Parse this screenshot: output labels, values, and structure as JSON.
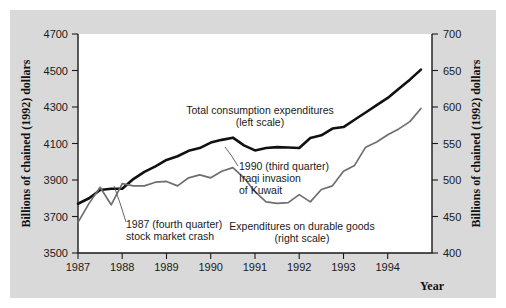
{
  "figure": {
    "background_color": "#d9d9d9",
    "plot_background_color": "#ffffff"
  },
  "chart_data": {
    "type": "line",
    "title": "",
    "xlabel": "Year",
    "ylabel": "Billions of chained (1992) dollars",
    "ylabel_right": "Billions of chained (1992) dollars",
    "xlim": [
      1987.0,
      1995.0
    ],
    "ylim": [
      3500,
      4700
    ],
    "ylim_right": [
      400,
      700
    ],
    "grid": false,
    "legend_position": "inline-annotations",
    "xticks": [
      1987,
      1988,
      1989,
      1990,
      1991,
      1992,
      1993,
      1994
    ],
    "xtick_labels": [
      "1987",
      "1988",
      "1989",
      "1990",
      "1991",
      "1992",
      "1993",
      "1994"
    ],
    "yticks": [
      3500,
      3700,
      3900,
      4100,
      4300,
      4500,
      4700
    ],
    "ytick_labels": [
      "3500",
      "3700",
      "3900",
      "4100",
      "4300",
      "4500",
      "4700"
    ],
    "yticks_right": [
      400,
      450,
      500,
      550,
      600,
      650,
      700
    ],
    "ytick_labels_right": [
      "400",
      "450",
      "500",
      "550",
      "600",
      "650",
      "700"
    ],
    "series": [
      {
        "name": "Total consumption expenditures",
        "scale": "left",
        "color": "#111111",
        "x": [
          1987.0,
          1987.25,
          1987.5,
          1987.75,
          1988.0,
          1988.25,
          1988.5,
          1988.75,
          1989.0,
          1989.25,
          1989.5,
          1989.75,
          1990.0,
          1990.25,
          1990.5,
          1990.75,
          1991.0,
          1991.25,
          1991.5,
          1991.75,
          1992.0,
          1992.25,
          1992.5,
          1992.75,
          1993.0,
          1993.25,
          1993.5,
          1993.75,
          1994.0,
          1994.25,
          1994.5,
          1994.75
        ],
        "values": [
          3770,
          3800,
          3845,
          3852,
          3852,
          3905,
          3945,
          3975,
          4010,
          4030,
          4060,
          4075,
          4105,
          4120,
          4132,
          4090,
          4062,
          4075,
          4080,
          4078,
          4075,
          4130,
          4145,
          4182,
          4190,
          4230,
          4270,
          4310,
          4350,
          4400,
          4450,
          4505
        ]
      },
      {
        "name": "Expenditures on durable goods",
        "scale": "right",
        "color": "#6e6e6e",
        "x": [
          1987.0,
          1987.25,
          1987.5,
          1987.75,
          1988.0,
          1988.25,
          1988.5,
          1988.75,
          1989.0,
          1989.25,
          1989.5,
          1989.75,
          1990.0,
          1990.25,
          1990.5,
          1990.75,
          1991.0,
          1991.25,
          1991.5,
          1991.75,
          1992.0,
          1992.25,
          1992.5,
          1992.75,
          1993.0,
          1993.25,
          1993.5,
          1993.75,
          1994.0,
          1994.25,
          1994.5,
          1994.75
        ],
        "values": [
          442,
          468,
          490,
          466,
          495,
          492,
          492,
          497,
          498,
          492,
          503,
          507,
          503,
          512,
          517,
          503,
          484,
          470,
          468,
          469,
          480,
          470,
          487,
          492,
          512,
          520,
          545,
          552,
          562,
          570,
          580,
          598
        ]
      }
    ],
    "annotations": [
      {
        "id": "total-consumption-label",
        "lines": [
          "Total consumption expenditures",
          "(left scale)"
        ],
        "x": 250,
        "y": 104
      },
      {
        "id": "iraq-invasion-label",
        "lines": [
          "1990 (third quarter)",
          "Iraqi invasion",
          "of Kuwait"
        ],
        "x": 229,
        "y": 160
      },
      {
        "id": "stock-crash-label",
        "lines": [
          "1987 (fourth quarter)",
          "stock market crash"
        ],
        "x": 116,
        "y": 218
      },
      {
        "id": "durable-goods-label",
        "lines": [
          "Expenditures on durable goods",
          "(right scale)"
        ],
        "x": 292,
        "y": 220
      }
    ]
  }
}
